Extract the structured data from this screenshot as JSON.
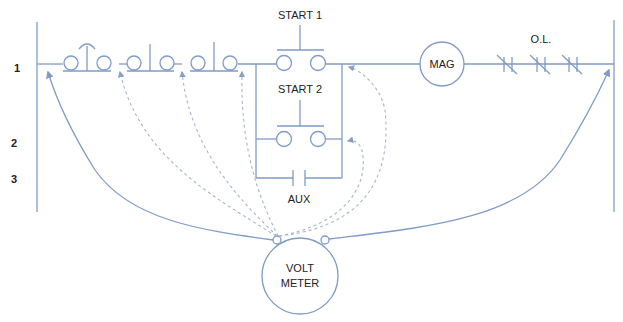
{
  "diagram": {
    "type": "ladder-wiring-diagram",
    "colors": {
      "wire": "#7f9bc6",
      "probe": "#a6b4cc",
      "text": "#222222"
    },
    "rung_numbers": [
      "1",
      "2",
      "3"
    ],
    "labels": {
      "start1": "START 1",
      "start2": "START 2",
      "aux": "AUX",
      "mag": "MAG",
      "overload": "O.L.",
      "voltmeter_line1": "VOLT",
      "voltmeter_line2": "METER"
    },
    "components": [
      {
        "id": "stop-switch-1",
        "kind": "normally-closed pushbutton (mushroom)"
      },
      {
        "id": "stop-switch-2",
        "kind": "normally-closed pushbutton"
      },
      {
        "id": "stop-switch-3",
        "kind": "normally-closed pushbutton"
      },
      {
        "id": "start-1",
        "kind": "normally-open pushbutton"
      },
      {
        "id": "start-2",
        "kind": "normally-open pushbutton"
      },
      {
        "id": "aux",
        "kind": "normally-open auxiliary contact"
      },
      {
        "id": "mag",
        "kind": "magnetic starter coil"
      },
      {
        "id": "ol",
        "kind": "overload contacts x3"
      },
      {
        "id": "voltmeter",
        "kind": "volt meter with two leads"
      }
    ]
  }
}
